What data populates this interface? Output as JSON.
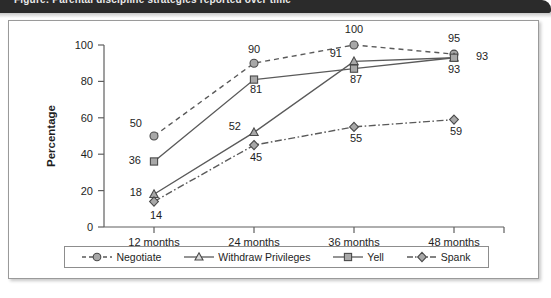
{
  "banner": {
    "text": "Figure: Parental discipline strategies reported over time"
  },
  "figure": {
    "axis": {
      "ylabel": "Percentage",
      "yticks": [
        "0",
        "20",
        "40",
        "60",
        "80",
        "100"
      ],
      "xticks": [
        "12 months",
        "24 months",
        "36 months",
        "48 months"
      ]
    }
  },
  "legend": {
    "items": [
      {
        "label": "Negotiate",
        "marker": "circle",
        "dash": "dashed"
      },
      {
        "label": "Withdraw Privileges",
        "marker": "triangle",
        "dash": "solid"
      },
      {
        "label": "Yell",
        "marker": "square",
        "dash": "solid"
      },
      {
        "label": "Spank",
        "marker": "diamond",
        "dash": "dashdot"
      }
    ]
  },
  "colors": {
    "line": "#5a5a5a",
    "marker_fill": "#a8a8a8",
    "marker_stroke": "#4a4a4a",
    "axis": "#5f5f5f",
    "text": "#1e1e1e",
    "banner_bg": "#2b2b2b",
    "frame": "#9a9a9a"
  },
  "chart_data": {
    "type": "line",
    "title": "",
    "xlabel": "",
    "ylabel": "Percentage",
    "categories": [
      "12 months",
      "24 months",
      "36 months",
      "48 months"
    ],
    "ylim": [
      0,
      100
    ],
    "ytick_step": 20,
    "grid": false,
    "legend_position": "bottom",
    "series": [
      {
        "name": "Negotiate",
        "marker": "circle",
        "dash": "dashed",
        "values": [
          50,
          90,
          100,
          95
        ]
      },
      {
        "name": "Withdraw Privileges",
        "marker": "triangle",
        "dash": "solid",
        "values": [
          18,
          52,
          91,
          93
        ]
      },
      {
        "name": "Yell",
        "marker": "square",
        "dash": "solid",
        "values": [
          36,
          81,
          87,
          93
        ]
      },
      {
        "name": "Spank",
        "marker": "diamond",
        "dash": "dashdot",
        "values": [
          14,
          45,
          55,
          59
        ]
      }
    ],
    "point_labels": {
      "Negotiate": [
        "50",
        "90",
        "100",
        "95"
      ],
      "Withdraw Privileges": [
        "18",
        "52",
        "91",
        "93"
      ],
      "Yell": [
        "36",
        "81",
        "87",
        "93"
      ],
      "Spank": [
        "14",
        "45",
        "55",
        "59"
      ]
    }
  }
}
